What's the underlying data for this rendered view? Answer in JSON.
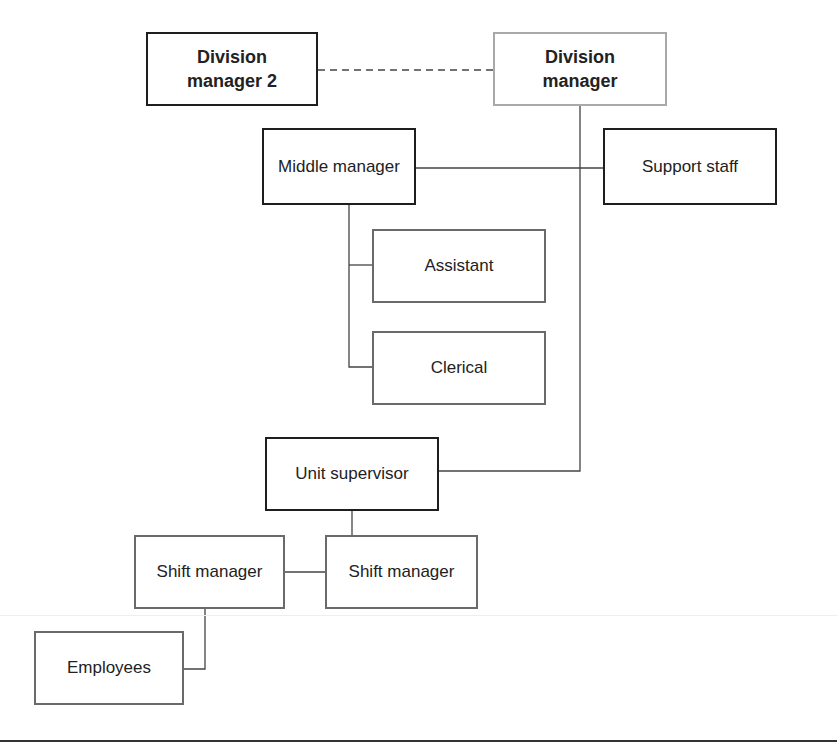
{
  "diagram": {
    "type": "org-chart",
    "nodes": [
      {
        "id": "div2",
        "label": "Division manager 2",
        "lines": [
          "Division",
          "manager 2"
        ],
        "style": "bold"
      },
      {
        "id": "div1",
        "label": "Division manager",
        "lines": [
          "Division",
          "manager"
        ],
        "style": "bold"
      },
      {
        "id": "middle",
        "label": "Middle manager"
      },
      {
        "id": "support",
        "label": "Support staff"
      },
      {
        "id": "assistant",
        "label": "Assistant"
      },
      {
        "id": "clerical",
        "label": "Clerical"
      },
      {
        "id": "unit",
        "label": "Unit supervisor"
      },
      {
        "id": "shiftL",
        "label": "Shift manager"
      },
      {
        "id": "shiftR",
        "label": "Shift manager"
      },
      {
        "id": "employees",
        "label": "Employees"
      }
    ],
    "edges": [
      {
        "from": "div2",
        "to": "div1",
        "style": "dashed"
      },
      {
        "from": "div1",
        "to": "unit",
        "style": "solid"
      },
      {
        "from": "middle",
        "to": "support",
        "style": "solid"
      },
      {
        "from": "middle",
        "to": "assistant",
        "style": "solid"
      },
      {
        "from": "middle",
        "to": "clerical",
        "style": "solid"
      },
      {
        "from": "unit",
        "to": "shiftL",
        "style": "solid"
      },
      {
        "from": "unit",
        "to": "shiftR",
        "style": "solid"
      },
      {
        "from": "shiftL",
        "to": "employees",
        "style": "solid"
      }
    ],
    "colors": {
      "line": "#444444",
      "dark_border": "#1e1e1e",
      "gray_border": "#6a6a6a",
      "light_border": "#a9a9a9"
    }
  }
}
